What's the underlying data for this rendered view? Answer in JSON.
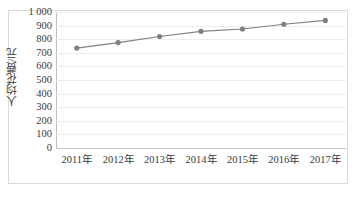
{
  "chart_data": {
    "type": "line",
    "title": "",
    "xlabel": "",
    "ylabel": "人均花费/元",
    "categories": [
      "2011年",
      "2012年",
      "2013年",
      "2014年",
      "2015年",
      "2016年",
      "2017年"
    ],
    "values": [
      735,
      775,
      820,
      858,
      875,
      910,
      938
    ],
    "series": [
      {
        "name": "人均花费",
        "values": [
          735,
          775,
          820,
          858,
          875,
          910,
          938
        ]
      }
    ],
    "ylim": [
      0,
      1000
    ],
    "y_ticks": [
      0,
      100,
      200,
      300,
      400,
      500,
      600,
      700,
      800,
      900,
      1000
    ],
    "y_tick_labels": [
      "0",
      "100",
      "200",
      "300",
      "400",
      "500",
      "600",
      "700",
      "800",
      "900",
      "1 000"
    ],
    "grid": true,
    "legend": "none",
    "marker": "circle",
    "line_color": "#808080",
    "marker_color": "#808080",
    "grid_color": "#ededed",
    "axis_color": "#bfbfbf",
    "text_color": "#3a3a3a"
  },
  "figure": {
    "frame_border_color": "#d9d9d9",
    "background": "#ffffff",
    "bottom_caption": ""
  }
}
